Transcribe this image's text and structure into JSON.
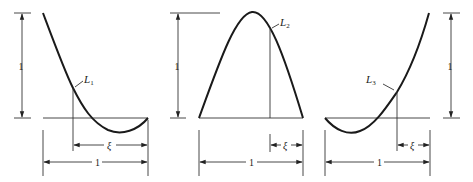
{
  "figure": {
    "panels": [
      {
        "id": "L1",
        "label_letter": "L",
        "label_sub": "1",
        "height_label": "1",
        "xi_label": "ξ",
        "width_label": "1"
      },
      {
        "id": "L2",
        "label_letter": "L",
        "label_sub": "2",
        "height_label": "1",
        "xi_label": "ξ",
        "width_label": "1"
      },
      {
        "id": "L3",
        "label_letter": "L",
        "label_sub": "3",
        "height_label": "1",
        "xi_label": "ξ",
        "width_label": "1"
      }
    ],
    "colors": {
      "stroke": "#1a1a1a",
      "background": "#ffffff"
    }
  }
}
